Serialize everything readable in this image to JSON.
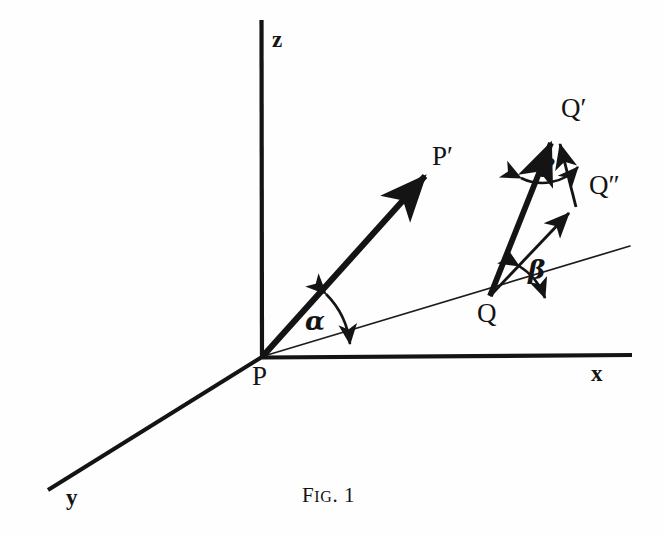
{
  "figure": {
    "caption_prefix": "F",
    "caption_smallcaps": "IG",
    "caption_suffix": ". 1",
    "caption_full": "Fig. 1",
    "background_color": "#fefefe",
    "ink_color": "#141414"
  },
  "axes": [
    {
      "id": "z",
      "label": "z",
      "from": [
        262,
        357
      ],
      "to": [
        261,
        20
      ]
    },
    {
      "id": "x",
      "label": "x",
      "from": [
        262,
        357
      ],
      "to": [
        632,
        355
      ]
    },
    {
      "id": "y",
      "label": "y",
      "from": [
        262,
        357
      ],
      "to": [
        48,
        490
      ]
    }
  ],
  "points": {
    "P": "P",
    "P_prime": "P′",
    "Q": "Q",
    "Q_prime": "Q′",
    "Q_double_prime": "Q″"
  },
  "angles": {
    "alpha": "α",
    "beta": "β",
    "gamma": "γ"
  },
  "vectors": [
    {
      "name": "P-to-P-prime",
      "from": [
        262,
        357
      ],
      "to": [
        432,
        168
      ],
      "weight": "thick",
      "arrow": true
    },
    {
      "name": "Q-to-Q-prime",
      "from": [
        490,
        296
      ],
      "to": [
        555,
        132
      ],
      "weight": "thick",
      "arrow": true
    },
    {
      "name": "Q-to-Q-double-prime",
      "from": [
        490,
        296
      ],
      "to": [
        575,
        206
      ],
      "weight": "thin",
      "arrow": true
    },
    {
      "name": "Q-double-prime-to-Q-prime",
      "from": [
        575,
        206
      ],
      "to": [
        557,
        134
      ],
      "weight": "thin",
      "arrow": true
    }
  ],
  "rays": [
    {
      "name": "ground-ray-through-Q",
      "from": [
        264,
        356
      ],
      "to": [
        630,
        246
      ],
      "weight": "hairline"
    }
  ]
}
